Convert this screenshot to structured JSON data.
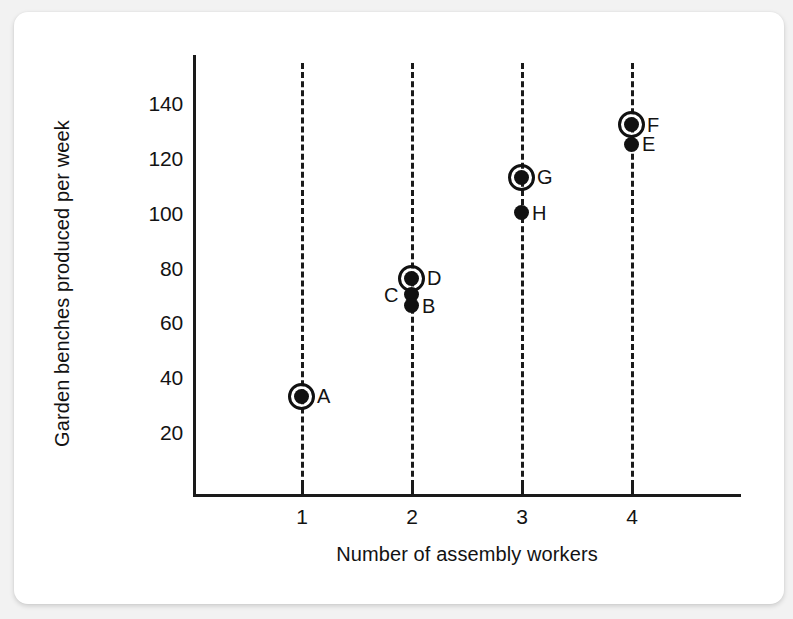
{
  "chart_data": {
    "type": "scatter",
    "title": "",
    "xlabel": "Number of assembly workers",
    "ylabel": "Garden benches produced per week",
    "xlim": [
      0.4,
      4.8
    ],
    "ylim": [
      0,
      152
    ],
    "x_ticks": [
      "1",
      "2",
      "3",
      "4"
    ],
    "y_ticks": [
      "20",
      "40",
      "60",
      "80",
      "100",
      "120",
      "140"
    ],
    "grid": "vertical dashed lines at each integer x tick",
    "legend": "none",
    "marker_note": "Filled black dots; a hollow ring around a dot marks the highest-output point for that number of workers",
    "points": [
      {
        "label": "A",
        "x": 1,
        "y": 33,
        "circled": true,
        "label_side": "right"
      },
      {
        "label": "D",
        "x": 2,
        "y": 76,
        "circled": true,
        "label_side": "right"
      },
      {
        "label": "C",
        "x": 2,
        "y": 70,
        "circled": false,
        "label_side": "left"
      },
      {
        "label": "B",
        "x": 2,
        "y": 66,
        "circled": false,
        "label_side": "right"
      },
      {
        "label": "G",
        "x": 3,
        "y": 113,
        "circled": true,
        "label_side": "right"
      },
      {
        "label": "H",
        "x": 3,
        "y": 100,
        "circled": false,
        "label_side": "right"
      },
      {
        "label": "F",
        "x": 4,
        "y": 132,
        "circled": true,
        "label_side": "right"
      },
      {
        "label": "E",
        "x": 4,
        "y": 125,
        "circled": false,
        "label_side": "right"
      }
    ],
    "colors": {
      "marker": "#111111",
      "axis": "#1a1a1a",
      "text": "#131313",
      "card_background": "#ffffff",
      "page_background": "#f2f2f2"
    }
  }
}
